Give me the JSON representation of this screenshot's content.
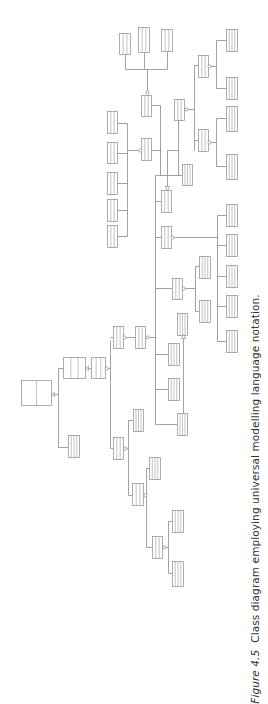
{
  "caption": {
    "label": "Figure 4.5",
    "text": "Class diagram employing universal modelling language notation."
  },
  "colors": {
    "line": "#8a8a8a",
    "box": "#9a9a9a",
    "fill": "#ffffff"
  },
  "diagram": {
    "type": "uml-class-diagram",
    "orientation": "rotated-90",
    "classes": [
      {
        "id": "c1",
        "x": 21,
        "y": 380,
        "w": 30,
        "h": 25,
        "parts": 2
      },
      {
        "id": "c2",
        "x": 63,
        "y": 357,
        "w": 22,
        "h": 21,
        "parts": 3
      },
      {
        "id": "c3",
        "x": 91,
        "y": 357,
        "w": 14,
        "h": 21,
        "parts": 3
      },
      {
        "id": "c4",
        "x": 68,
        "y": 435,
        "w": 11,
        "h": 22,
        "parts": 4
      },
      {
        "id": "c5",
        "x": 113,
        "y": 326,
        "w": 10,
        "h": 22,
        "parts": 3
      },
      {
        "id": "c6",
        "x": 135,
        "y": 326,
        "w": 10,
        "h": 22,
        "parts": 3
      },
      {
        "id": "c7",
        "x": 113,
        "y": 437,
        "w": 10,
        "h": 22,
        "parts": 3
      },
      {
        "id": "c8",
        "x": 133,
        "y": 409,
        "w": 10,
        "h": 22,
        "parts": 4
      },
      {
        "id": "c9",
        "x": 149,
        "y": 457,
        "w": 11,
        "h": 22,
        "parts": 4
      },
      {
        "id": "c10",
        "x": 132,
        "y": 483,
        "w": 11,
        "h": 22,
        "parts": 3
      },
      {
        "id": "c11",
        "x": 152,
        "y": 536,
        "w": 10,
        "h": 22,
        "parts": 3
      },
      {
        "id": "c12",
        "x": 172,
        "y": 510,
        "w": 11,
        "h": 22,
        "parts": 4
      },
      {
        "id": "c13",
        "x": 172,
        "y": 561,
        "w": 11,
        "h": 25,
        "parts": 4
      },
      {
        "id": "c14",
        "x": 168,
        "y": 343,
        "w": 11,
        "h": 22,
        "parts": 4
      },
      {
        "id": "c15",
        "x": 168,
        "y": 378,
        "w": 11,
        "h": 22,
        "parts": 4
      },
      {
        "id": "c16",
        "x": 177,
        "y": 413,
        "w": 10,
        "h": 22,
        "parts": 4
      },
      {
        "id": "c17",
        "x": 177,
        "y": 313,
        "w": 10,
        "h": 22,
        "parts": 4
      },
      {
        "id": "c18",
        "x": 172,
        "y": 278,
        "w": 10,
        "h": 21,
        "parts": 3
      },
      {
        "id": "c19",
        "x": 199,
        "y": 256,
        "w": 11,
        "h": 22,
        "parts": 4
      },
      {
        "id": "c20",
        "x": 199,
        "y": 300,
        "w": 11,
        "h": 22,
        "parts": 4
      },
      {
        "id": "c21",
        "x": 226,
        "y": 204,
        "w": 11,
        "h": 22,
        "parts": 4
      },
      {
        "id": "c22",
        "x": 226,
        "y": 234,
        "w": 11,
        "h": 22,
        "parts": 4
      },
      {
        "id": "c23",
        "x": 226,
        "y": 265,
        "w": 11,
        "h": 22,
        "parts": 4
      },
      {
        "id": "c24",
        "x": 226,
        "y": 295,
        "w": 11,
        "h": 22,
        "parts": 4
      },
      {
        "id": "c25",
        "x": 226,
        "y": 330,
        "w": 11,
        "h": 22,
        "parts": 4
      },
      {
        "id": "c26",
        "x": 161,
        "y": 226,
        "w": 10,
        "h": 22,
        "parts": 3
      },
      {
        "id": "c27",
        "x": 161,
        "y": 190,
        "w": 10,
        "h": 22,
        "parts": 3
      },
      {
        "id": "c28",
        "x": 182,
        "y": 164,
        "w": 10,
        "h": 21,
        "parts": 4
      },
      {
        "id": "c29",
        "x": 174,
        "y": 99,
        "w": 10,
        "h": 21,
        "parts": 3
      },
      {
        "id": "c30",
        "x": 141,
        "y": 95,
        "w": 10,
        "h": 21,
        "parts": 3
      },
      {
        "id": "c31",
        "x": 141,
        "y": 138,
        "w": 10,
        "h": 22,
        "parts": 3
      },
      {
        "id": "c32",
        "x": 119,
        "y": 33,
        "w": 11,
        "h": 21,
        "parts": 3
      },
      {
        "id": "c33",
        "x": 138,
        "y": 27,
        "w": 11,
        "h": 25,
        "parts": 3
      },
      {
        "id": "c34",
        "x": 161,
        "y": 29,
        "w": 11,
        "h": 22,
        "parts": 3
      },
      {
        "id": "c35",
        "x": 107,
        "y": 111,
        "w": 10,
        "h": 22,
        "parts": 3
      },
      {
        "id": "c36",
        "x": 107,
        "y": 142,
        "w": 10,
        "h": 21,
        "parts": 3
      },
      {
        "id": "c37",
        "x": 107,
        "y": 172,
        "w": 10,
        "h": 22,
        "parts": 3
      },
      {
        "id": "c38",
        "x": 107,
        "y": 199,
        "w": 10,
        "h": 22,
        "parts": 3
      },
      {
        "id": "c39",
        "x": 107,
        "y": 225,
        "w": 10,
        "h": 22,
        "parts": 3
      },
      {
        "id": "c40",
        "x": 198,
        "y": 55,
        "w": 10,
        "h": 22,
        "parts": 3
      },
      {
        "id": "c41",
        "x": 198,
        "y": 129,
        "w": 10,
        "h": 22,
        "parts": 3
      },
      {
        "id": "c42",
        "x": 226,
        "y": 29,
        "w": 11,
        "h": 22,
        "parts": 4
      },
      {
        "id": "c43",
        "x": 226,
        "y": 77,
        "w": 11,
        "h": 22,
        "parts": 4
      },
      {
        "id": "c44",
        "x": 226,
        "y": 106,
        "w": 11,
        "h": 25,
        "parts": 4
      },
      {
        "id": "c45",
        "x": 226,
        "y": 154,
        "w": 11,
        "h": 25,
        "parts": 4
      }
    ],
    "lines": [
      [
        51,
        394,
        58,
        394
      ],
      [
        58,
        368,
        58,
        447
      ],
      [
        58,
        368,
        63,
        368
      ],
      [
        58,
        447,
        68,
        447
      ],
      [
        85,
        368,
        91,
        368
      ],
      [
        105,
        368,
        110,
        368
      ],
      [
        110,
        340,
        110,
        448
      ],
      [
        110,
        337,
        113,
        337
      ],
      [
        110,
        448,
        113,
        448
      ],
      [
        123,
        337,
        135,
        337
      ],
      [
        145,
        337,
        155,
        337
      ],
      [
        155,
        175,
        155,
        424
      ],
      [
        155,
        354,
        168,
        354
      ],
      [
        155,
        389,
        168,
        389
      ],
      [
        155,
        424,
        177,
        424
      ],
      [
        155,
        288,
        172,
        288
      ],
      [
        155,
        237,
        161,
        237
      ],
      [
        155,
        201,
        161,
        201
      ],
      [
        155,
        175,
        182,
        175
      ],
      [
        123,
        448,
        128,
        448
      ],
      [
        128,
        420,
        128,
        495
      ],
      [
        128,
        420,
        133,
        420
      ],
      [
        128,
        495,
        132,
        495
      ],
      [
        143,
        495,
        146,
        495
      ],
      [
        146,
        468,
        146,
        547
      ],
      [
        146,
        468,
        149,
        468
      ],
      [
        146,
        547,
        152,
        547
      ],
      [
        162,
        547,
        168,
        547
      ],
      [
        168,
        521,
        168,
        573
      ],
      [
        168,
        521,
        172,
        521
      ],
      [
        168,
        573,
        172,
        573
      ],
      [
        183,
        335,
        183,
        424
      ],
      [
        183,
        288,
        195,
        288
      ],
      [
        195,
        266,
        195,
        311
      ],
      [
        195,
        266,
        199,
        266
      ],
      [
        195,
        311,
        199,
        311
      ],
      [
        171,
        237,
        217,
        237
      ],
      [
        217,
        215,
        217,
        341
      ],
      [
        217,
        215,
        226,
        215
      ],
      [
        217,
        245,
        226,
        245
      ],
      [
        217,
        276,
        226,
        276
      ],
      [
        217,
        306,
        226,
        306
      ],
      [
        217,
        341,
        226,
        341
      ],
      [
        178,
        120,
        178,
        175
      ],
      [
        167,
        188,
        167,
        150
      ],
      [
        167,
        150,
        178,
        150
      ],
      [
        184,
        109,
        194,
        109
      ],
      [
        194,
        65,
        194,
        150
      ],
      [
        194,
        65,
        198,
        65
      ],
      [
        194,
        140,
        198,
        140
      ],
      [
        208,
        66,
        216,
        66
      ],
      [
        216,
        40,
        216,
        88
      ],
      [
        216,
        40,
        226,
        40
      ],
      [
        216,
        88,
        226,
        88
      ],
      [
        208,
        142,
        216,
        142
      ],
      [
        216,
        118,
        216,
        166
      ],
      [
        216,
        118,
        226,
        118
      ],
      [
        216,
        166,
        226,
        166
      ],
      [
        147,
        92,
        147,
        69
      ],
      [
        125,
        69,
        167,
        69
      ],
      [
        125,
        54,
        125,
        69
      ],
      [
        144,
        52,
        144,
        69
      ],
      [
        167,
        51,
        167,
        69
      ],
      [
        151,
        105,
        160,
        105
      ],
      [
        160,
        105,
        160,
        175
      ],
      [
        117,
        123,
        127,
        123
      ],
      [
        117,
        153,
        127,
        153
      ],
      [
        117,
        183,
        127,
        183
      ],
      [
        117,
        210,
        127,
        210
      ],
      [
        117,
        236,
        127,
        236
      ],
      [
        127,
        123,
        127,
        236
      ],
      [
        127,
        150,
        141,
        150
      ],
      [
        151,
        150,
        161,
        150
      ]
    ],
    "markers": [
      {
        "type": "triangle",
        "x": 51,
        "y": 394,
        "dir": "left"
      },
      {
        "type": "triangle",
        "x": 85,
        "y": 368,
        "dir": "left"
      },
      {
        "type": "diamond",
        "x": 106,
        "y": 368
      },
      {
        "type": "circle",
        "x": 124,
        "y": 337
      },
      {
        "type": "circle",
        "x": 147,
        "y": 337
      },
      {
        "type": "circle",
        "x": 125,
        "y": 448
      },
      {
        "type": "circle",
        "x": 145,
        "y": 495
      },
      {
        "type": "circle",
        "x": 164,
        "y": 547
      },
      {
        "type": "arrow",
        "x": 183,
        "y": 336,
        "dir": "up"
      },
      {
        "type": "circle",
        "x": 183,
        "y": 288
      },
      {
        "type": "diamond",
        "x": 172,
        "y": 237
      },
      {
        "type": "arrow",
        "x": 167,
        "y": 188,
        "dir": "down"
      },
      {
        "type": "circle",
        "x": 186,
        "y": 109
      },
      {
        "type": "circle",
        "x": 147,
        "y": 92
      },
      {
        "type": "circle",
        "x": 140,
        "y": 150
      },
      {
        "type": "circle",
        "x": 209,
        "y": 66
      },
      {
        "type": "circle",
        "x": 209,
        "y": 142
      }
    ]
  }
}
